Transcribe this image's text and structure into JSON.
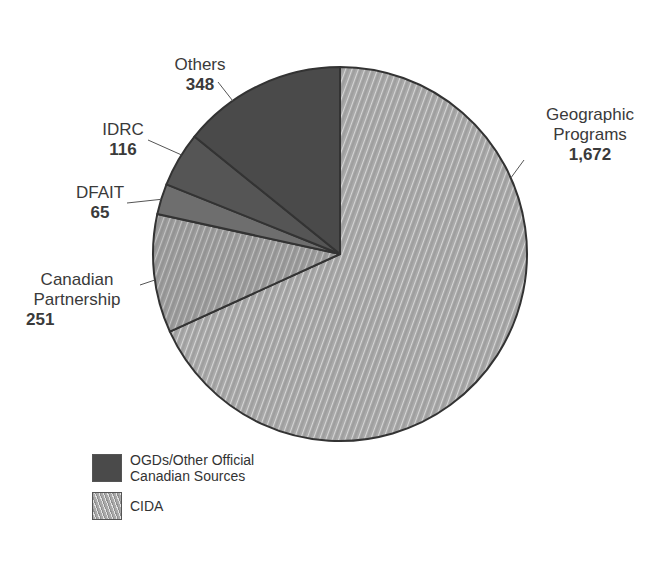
{
  "chart_data": {
    "type": "pie",
    "title": "",
    "start_angle_deg": 0,
    "direction": "clockwise",
    "slices": [
      {
        "label": "Geographic Programs",
        "label_lines": [
          "Geographic",
          "Programs"
        ],
        "value": 1672,
        "value_text": "1,672",
        "group": "CIDA"
      },
      {
        "label": "Canadian Partnership",
        "label_lines": [
          "Canadian",
          "Partnership"
        ],
        "value": 251,
        "value_text": "251",
        "group": "CIDA"
      },
      {
        "label": "DFAIT",
        "label_lines": [
          "DFAIT"
        ],
        "value": 65,
        "value_text": "65",
        "group": "OGDs/Other Official Canadian Sources"
      },
      {
        "label": "IDRC",
        "label_lines": [
          "IDRC"
        ],
        "value": 116,
        "value_text": "116",
        "group": "OGDs/Other Official Canadian Sources"
      },
      {
        "label": "Others",
        "label_lines": [
          "Others"
        ],
        "value": 348,
        "value_text": "348",
        "group": "OGDs/Other Official Canadian Sources"
      }
    ],
    "legend": [
      {
        "label_lines": [
          "OGDs/Other Official",
          "Canadian Sources"
        ],
        "pattern": "dark-solid",
        "color": "#4a4a4a"
      },
      {
        "label_lines": [
          "CIDA"
        ],
        "pattern": "light-hatched",
        "color": "#a8a8a8"
      }
    ],
    "legend_position": "bottom-left"
  },
  "colors": {
    "cida_fill": "#a9a9a9",
    "cida_hatch": "#e6e6e6",
    "ogd_dark": "#4a4a4a",
    "ogd_mid": "#6e6e6e",
    "ogd_idrc": "#555555",
    "outline": "#333333",
    "leader": "#555555"
  }
}
